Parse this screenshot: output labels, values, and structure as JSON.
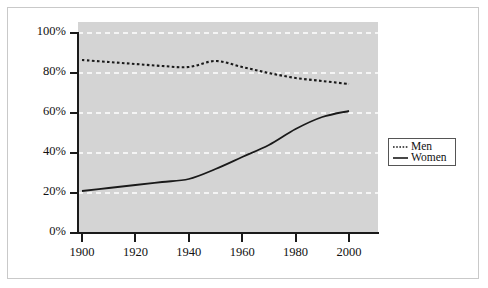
{
  "chart_data": {
    "type": "line",
    "title": "",
    "subtitle": "",
    "xlabel": "",
    "ylabel": "",
    "xlim": [
      1900,
      2000
    ],
    "ylim": [
      0,
      100
    ],
    "grid": true,
    "grid_color": "#ffffff",
    "panel_color": "#d4d4d4",
    "legend_position": "right",
    "x_tick_labels": [
      "1900",
      "1920",
      "1940",
      "1960",
      "1980",
      "2000"
    ],
    "x_ticks": [
      1900,
      1920,
      1940,
      1960,
      1980,
      2000
    ],
    "y_tick_labels": [
      "0%",
      "20%",
      "40%",
      "60%",
      "80%",
      "100%"
    ],
    "y_ticks": [
      0,
      20,
      40,
      60,
      80,
      100
    ],
    "x": [
      1900,
      1910,
      1920,
      1930,
      1940,
      1950,
      1960,
      1970,
      1980,
      1990,
      2000
    ],
    "series": [
      {
        "name": "Men",
        "style": "dotted",
        "color": "#1a1a1a",
        "values": [
          86.5,
          85.5,
          84.5,
          83.5,
          83.0,
          86.0,
          83.0,
          80.0,
          77.5,
          76.0,
          74.5
        ]
      },
      {
        "name": "Women",
        "style": "solid",
        "color": "#1a1a1a",
        "values": [
          21.0,
          22.5,
          24.0,
          25.5,
          27.0,
          32.0,
          38.0,
          44.0,
          52.0,
          58.0,
          61.0
        ]
      }
    ]
  },
  "legend": {
    "entries": [
      {
        "label": "Men",
        "style": "dotted"
      },
      {
        "label": "Women",
        "style": "solid"
      }
    ]
  }
}
